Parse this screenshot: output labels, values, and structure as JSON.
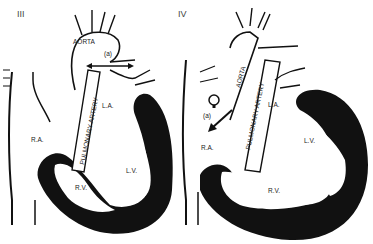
{
  "panels": [
    {
      "numeral": "III",
      "labels": {
        "aorta": "AORTA",
        "pulmonary_artery": "PULMONARY ARTERY",
        "left_atrium": "L.A.",
        "right_atrium": "R.A.",
        "right_ventricle": "R.V.",
        "left_ventricle": "L.V.",
        "annotation": "(a)"
      }
    },
    {
      "numeral": "IV",
      "labels": {
        "aorta": "AORTA",
        "pulmonary_artery": "PULMONARY ARTERY",
        "left_atrium": "L.A.",
        "right_atrium": "R.A.",
        "right_ventricle": "R.V.",
        "left_ventricle": "L.V.",
        "annotation": "(a)"
      }
    }
  ],
  "colors": {
    "ink": "#111111",
    "background": "#ffffff"
  }
}
